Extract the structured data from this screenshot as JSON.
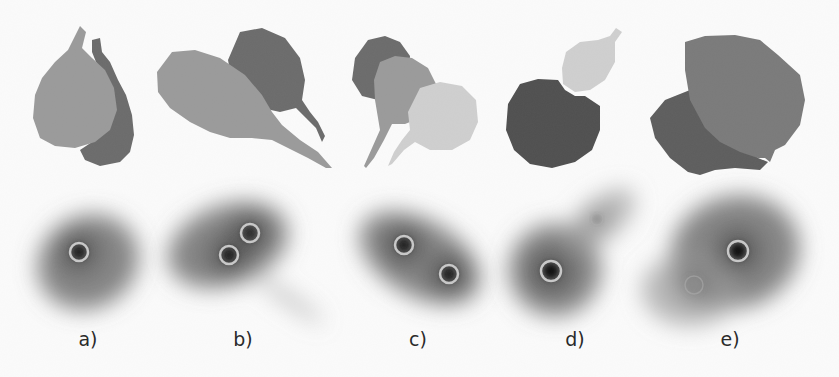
{
  "figure": {
    "panels": [
      {
        "id": "a",
        "label": "a)",
        "label_x": 88,
        "masks": [
          {
            "shade": "#6b6b6b",
            "path": "M92,40 L100,38 L102,52 L110,62 L118,80 L126,95 L132,115 L134,135 L130,152 L120,162 L100,166 L85,160 L80,150 L95,140 L110,125 L115,100 L108,80 L96,62 L92,52 Z"
          },
          {
            "shade": "#9a9a9a",
            "path": "M80,26 L86,32 L82,48 L92,58 L105,70 L114,88 L117,110 L110,130 L95,142 L75,148 L55,146 L40,138 L33,118 L35,95 L42,78 L55,62 L68,50 Z"
          }
        ],
        "markers": [
          {
            "cx": 79,
            "cy": 252,
            "r": 9,
            "core": "#1e1e1e"
          }
        ],
        "blob": [
          {
            "cx": 88,
            "cy": 262,
            "rx": 52,
            "ry": 46,
            "rot": -30
          }
        ]
      },
      {
        "id": "b",
        "label": "b)",
        "label_x": 243,
        "masks": [
          {
            "shade": "#6b6b6b",
            "path": "M240,32 L262,28 L285,38 L300,58 L305,80 L302,100 L310,112 L318,122 L325,136 L322,142 L316,128 L306,118 L296,108 L280,112 L262,108 L245,100 L232,82 L228,60 Z"
          },
          {
            "shade": "#9a9a9a",
            "path": "M172,52 L195,50 L220,58 L245,75 L262,95 L272,112 L282,125 L300,140 L318,152 L332,168 L326,168 L308,158 L288,148 L272,140 L252,138 L230,138 L210,132 L190,122 L170,108 L158,92 L157,72 Z"
          }
        ],
        "markers": [
          {
            "cx": 229,
            "cy": 255,
            "r": 9,
            "core": "#1e1e1e"
          },
          {
            "cx": 250,
            "cy": 233,
            "r": 9,
            "core": "#2a2a2a"
          }
        ],
        "blob": [
          {
            "cx": 228,
            "cy": 245,
            "rx": 62,
            "ry": 40,
            "rot": -20
          },
          {
            "cx": 290,
            "cy": 300,
            "rx": 40,
            "ry": 5,
            "rot": 35
          }
        ]
      },
      {
        "id": "c",
        "label": "c)",
        "label_x": 418,
        "masks": [
          {
            "shade": "#6b6b6b",
            "path": "M355,58 L368,40 L385,36 L400,42 L410,56 L408,80 L395,95 L378,100 L362,96 L352,80 Z"
          },
          {
            "shade": "#9a9a9a",
            "path": "M380,62 L395,56 L412,58 L428,68 L436,84 L432,104 L420,118 L405,124 L392,124 L384,140 L374,158 L366,168 L364,166 L372,148 L380,130 L378,118 L375,100 L374,80 Z"
          },
          {
            "shade": "#cfcfcf",
            "path": "M420,88 L440,82 L462,86 L476,100 L478,122 L470,140 L452,150 L430,150 L415,142 L404,150 L392,164 L388,166 L394,152 L402,140 L410,130 L408,112 Z"
          }
        ],
        "markers": [
          {
            "cx": 404,
            "cy": 245,
            "r": 9,
            "core": "#1e1e1e"
          },
          {
            "cx": 449,
            "cy": 274,
            "r": 9,
            "core": "#1e1e1e"
          }
        ],
        "blob": [
          {
            "cx": 420,
            "cy": 258,
            "rx": 66,
            "ry": 38,
            "rot": 30
          }
        ]
      },
      {
        "id": "d",
        "label": "d)",
        "label_x": 575,
        "masks": [
          {
            "shade": "#cfcfcf",
            "path": "M566,52 L580,42 L598,40 L610,36 L616,28 L622,32 L615,42 L615,62 L605,80 L590,90 L575,92 L563,84 L562,68 Z"
          },
          {
            "shade": "#4f4f4f",
            "path": "M520,84 L538,79 L558,80 L565,90 L575,96 L585,96 L600,106 L600,130 L592,150 L575,162 L552,168 L530,164 L514,150 L506,130 L508,104 Z"
          }
        ],
        "markers": [
          {
            "cx": 551,
            "cy": 271,
            "r": 10,
            "core": "#0f0f0f"
          },
          {
            "cx": 597,
            "cy": 219,
            "r": 6,
            "core": "#888888",
            "faint": true
          }
        ],
        "blob": [
          {
            "cx": 555,
            "cy": 270,
            "rx": 46,
            "ry": 46,
            "rot": 0
          },
          {
            "cx": 600,
            "cy": 220,
            "rx": 42,
            "ry": 20,
            "rot": -40
          }
        ]
      },
      {
        "id": "e",
        "label": "e)",
        "label_x": 730,
        "masks": [
          {
            "shade": "#5d5d5d",
            "path": "M665,100 L690,90 L705,98 L720,118 L740,140 L758,158 L768,162 L760,170 L735,168 L715,170 L700,175 L688,172 L670,158 L655,138 L650,118 Z"
          },
          {
            "shade": "#7a7a7a",
            "path": "M685,42 L705,36 L735,35 L760,40 L778,55 L800,75 L805,100 L800,125 L785,145 L775,150 L770,162 L765,158 L758,158 L740,152 L720,142 L705,128 L690,100 L685,70 Z"
          }
        ],
        "markers": [
          {
            "cx": 738,
            "cy": 251,
            "r": 10,
            "core": "#111111"
          },
          {
            "cx": 694,
            "cy": 285,
            "r": 9,
            "core": "#8a8a8a",
            "faint": true
          }
        ],
        "blob": [
          {
            "cx": 735,
            "cy": 252,
            "rx": 65,
            "ry": 56,
            "rot": -15
          },
          {
            "cx": 690,
            "cy": 290,
            "rx": 48,
            "ry": 36,
            "rot": 0
          }
        ]
      }
    ]
  }
}
